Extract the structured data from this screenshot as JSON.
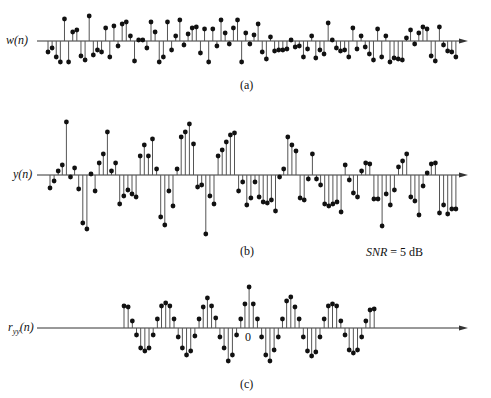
{
  "figure": {
    "panels": [
      {
        "id": "a",
        "ylabel": "w(n)",
        "caption": "(a)",
        "baseline_y": 41,
        "axis_x_start": 37,
        "axis_x_end": 468,
        "first_x": 48,
        "dx": 4.12,
        "values": [
          -11,
          -7,
          -16,
          -21,
          22,
          -21,
          9,
          11,
          -15,
          -19,
          25,
          -14,
          -9,
          -11,
          13,
          -16,
          15,
          -5,
          17,
          19,
          5,
          -20,
          1,
          1,
          -7,
          19,
          9,
          -21,
          -16,
          19,
          -9,
          5,
          21,
          -4,
          7,
          13,
          14,
          -12,
          12,
          -21,
          12,
          -5,
          21,
          8,
          -3,
          13,
          21,
          -21,
          8,
          -3,
          6,
          17,
          -11,
          -18,
          4,
          -10,
          -9,
          -9,
          -8,
          1,
          -6,
          -5,
          -16,
          -8,
          5,
          -17,
          -9,
          -13,
          18,
          1,
          -7,
          -10,
          -9,
          -16,
          13,
          -8,
          5,
          -6,
          -13,
          -19,
          12,
          -16,
          5,
          -21,
          -17,
          -18,
          -19,
          3,
          11,
          -3,
          8,
          14,
          12,
          -15,
          -20,
          14,
          -4,
          -10,
          -11,
          -16,
          -20,
          -1,
          -16,
          -7,
          2,
          1,
          -19,
          -19,
          -6,
          -4,
          1,
          0
        ],
        "n": 100
      },
      {
        "id": "b",
        "ylabel": "y(n)",
        "caption": "(b)",
        "baseline_y": 175,
        "axis_x_start": 37,
        "axis_x_end": 468,
        "first_x": 50,
        "dx": 4.1,
        "values": [
          -13,
          -6,
          4,
          10,
          53,
          -2,
          7,
          -14,
          -48,
          -54,
          1,
          -16,
          12,
          21,
          43,
          4,
          12,
          -29,
          -21,
          -15,
          -19,
          -22,
          19,
          30,
          19,
          36,
          6,
          -42,
          -50,
          -16,
          -31,
          6,
          38,
          43,
          51,
          31,
          -12,
          -10,
          -59,
          -21,
          -29,
          19,
          25,
          33,
          40,
          42,
          -16,
          -7,
          -30,
          -23,
          -7,
          -22,
          -27,
          -28,
          -25,
          -36,
          -2,
          6,
          38,
          30,
          24,
          -23,
          -25,
          -4,
          21,
          -4,
          -10,
          -29,
          -31,
          -29,
          -27,
          -37,
          10,
          -5,
          -18,
          -22,
          4,
          12,
          11,
          -24,
          -24,
          -51,
          -19,
          -30,
          -15,
          8,
          14,
          21,
          -22,
          -26,
          -40,
          -11,
          2,
          11,
          12,
          -38,
          -30,
          -39,
          -34,
          -34,
          26,
          -25,
          35,
          24,
          -38,
          -46,
          -48,
          -37,
          -37,
          4,
          -1,
          -4
        ],
        "n": 100
      },
      {
        "id": "c",
        "ylabel": "r_yy(n)",
        "caption": "(c)",
        "baseline_y": 328,
        "axis_x_start": 37,
        "axis_x_end": 468,
        "first_x": 124,
        "dx": 4.17,
        "values": [
          22,
          21,
          7,
          -7,
          -20,
          -23,
          -20,
          -7,
          9,
          22,
          25,
          22,
          9,
          -9,
          -20,
          -27,
          -23,
          -8,
          9,
          21,
          30,
          22,
          10,
          -9,
          -20,
          -33,
          -27,
          -7,
          9,
          24,
          41,
          24,
          9,
          -9,
          -27,
          -33,
          -22,
          -9,
          9,
          27,
          31,
          21,
          9,
          -9,
          -23,
          -28,
          -24,
          -9,
          9,
          22,
          24,
          22,
          7,
          -7,
          -22,
          -25,
          -22,
          -9,
          7,
          18,
          19
        ],
        "n": 61
      }
    ],
    "zero_label": "0",
    "annotation": {
      "italic": "SNR",
      "rest": " = 5 dB"
    },
    "stem_color": "#555555",
    "marker_color": "#111111",
    "axis_color": "#333333"
  },
  "chart_data": [
    {
      "type": "stem",
      "title": "(a)",
      "ylabel": "w(n)",
      "xlabel": "n",
      "grid": false,
      "description": "Random noise sequence w(n), ~100 samples, zero mean, amplitude roughly uniform in [-1, 1]",
      "ylim": [
        -1,
        1
      ],
      "values_normalized": [
        -0.44,
        -0.28,
        -0.64,
        -0.84,
        0.88,
        -0.84,
        0.36,
        0.44,
        -0.6,
        -0.76,
        1.0,
        -0.56,
        -0.36,
        -0.44,
        0.52,
        -0.64,
        0.6,
        -0.2,
        0.68,
        0.76,
        0.2,
        -0.8,
        0.04,
        0.04,
        -0.28,
        0.76,
        0.36,
        -0.84,
        -0.64,
        0.76,
        -0.36,
        0.2,
        0.84,
        -0.16,
        0.28,
        0.52,
        0.56,
        -0.48,
        0.48,
        -0.84,
        0.48,
        -0.2,
        0.84,
        0.32,
        -0.12,
        0.52,
        0.84,
        -0.84,
        0.32,
        -0.12,
        0.24,
        0.68,
        -0.44,
        -0.72,
        0.16,
        -0.4,
        -0.36,
        -0.36,
        -0.32,
        0.04,
        -0.24,
        -0.2,
        -0.64,
        -0.32,
        0.2,
        -0.68,
        -0.36,
        -0.52,
        0.72,
        0.04,
        -0.28,
        -0.4,
        -0.36,
        -0.64,
        0.52,
        -0.32,
        0.2,
        -0.24,
        -0.52,
        -0.76,
        0.48,
        -0.64,
        0.2,
        -0.84,
        -0.68,
        -0.72,
        -0.76,
        0.12,
        0.44,
        -0.12,
        0.32,
        0.56,
        0.48,
        -0.6,
        -0.8,
        0.56,
        -0.16,
        -0.4,
        -0.44,
        -0.64
      ]
    },
    {
      "type": "stem",
      "title": "(b)",
      "ylabel": "y(n)",
      "xlabel": "n",
      "grid": false,
      "description": "Noisy periodic signal y(n) = x(n) + w(n), ~100 samples, period ~12 samples",
      "annotation": "SNR = 5 dB",
      "ylim": [
        -1.1,
        1.0
      ]
    },
    {
      "type": "stem",
      "title": "(c)",
      "ylabel": "r_yy(n)",
      "xlabel": "n",
      "grid": false,
      "description": "Autocorrelation r_yy(n), 61 lags centered at 0, peak at lag 0, periodic with period ~12 lags",
      "x_tick_labels": [
        "0"
      ],
      "x_range": [
        -30,
        30
      ],
      "values_normalized": [
        0.54,
        0.51,
        0.17,
        -0.17,
        -0.49,
        -0.56,
        -0.49,
        -0.17,
        0.22,
        0.54,
        0.61,
        0.54,
        0.22,
        -0.22,
        -0.49,
        -0.66,
        -0.56,
        -0.2,
        0.22,
        0.51,
        0.73,
        0.54,
        0.24,
        -0.22,
        -0.49,
        -0.8,
        -0.66,
        -0.17,
        0.22,
        0.59,
        1.0,
        0.59,
        0.22,
        -0.22,
        -0.66,
        -0.8,
        -0.54,
        -0.22,
        0.22,
        0.66,
        0.76,
        0.51,
        0.22,
        -0.22,
        -0.56,
        -0.68,
        -0.59,
        -0.22,
        0.22,
        0.54,
        0.59,
        0.54,
        0.17,
        -0.17,
        -0.54,
        -0.61,
        -0.54,
        -0.22,
        0.17,
        0.44,
        0.46
      ]
    }
  ]
}
